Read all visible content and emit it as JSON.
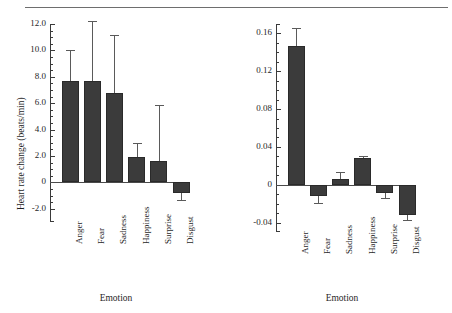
{
  "figure": {
    "top_rule": true,
    "bar_color": "#3b3b3b",
    "error_color": "#5a5a5a",
    "axis_color": "#3a3a3a"
  },
  "chart_data": [
    {
      "type": "bar",
      "panel": "left",
      "title": "",
      "xlabel": "Emotion",
      "ylabel": "Heart rate change (beats/min)",
      "categories": [
        "Anger",
        "Fear",
        "Sadness",
        "Happiness",
        "Surprise",
        "Disgust"
      ],
      "values": [
        7.7,
        7.7,
        6.8,
        1.9,
        1.6,
        -0.8
      ],
      "errors_upper": [
        10.0,
        12.2,
        11.2,
        3.0,
        5.9,
        -0.2
      ],
      "errors_lower": [
        7.7,
        7.7,
        6.8,
        1.9,
        1.6,
        -1.3
      ],
      "ylim": [
        -3.0,
        12.0
      ],
      "yticks": [
        12.0,
        10.0,
        8.0,
        6.0,
        4.0,
        2.0,
        0,
        -2.0
      ],
      "yticklabels": [
        "12.0",
        "10.0",
        "8.0",
        "6.0",
        "4.0",
        "2.0",
        "0",
        "-2.0"
      ],
      "minor_ticks": true,
      "grid": false,
      "legend": "none"
    },
    {
      "type": "bar",
      "panel": "right",
      "title": "",
      "xlabel": "Emotion",
      "ylabel": "Finger temperature change (degrees)",
      "categories": [
        "Anger",
        "Fear",
        "Sadness",
        "Happiness",
        "Surprise",
        "Disgust"
      ],
      "values": [
        0.147,
        -0.012,
        0.006,
        0.028,
        -0.009,
        -0.032
      ],
      "errors_upper": [
        0.166,
        -0.012,
        0.013,
        0.03,
        -0.009,
        -0.032
      ],
      "errors_lower": [
        0.147,
        -0.019,
        0.006,
        0.026,
        -0.014,
        -0.037
      ],
      "ylim": [
        -0.05,
        0.17
      ],
      "yticks": [
        0.16,
        0.12,
        0.08,
        0.04,
        0,
        -0.04
      ],
      "yticklabels": [
        "0.16",
        "0.12",
        "0.08",
        "0.04",
        "0",
        "-0.04"
      ],
      "minor_ticks": true,
      "grid": false,
      "legend": "none"
    }
  ]
}
